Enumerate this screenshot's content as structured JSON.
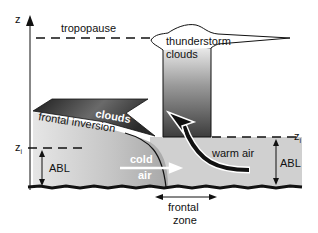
{
  "diagram": {
    "axis_label": "z",
    "tropopause_label": "tropopause",
    "thunderstorm_label_line1": "thunderstorm",
    "thunderstorm_label_line2": "clouds",
    "clouds_label": "clouds",
    "frontal_inversion_label": "frontal inversion",
    "zi_left_label": "z",
    "zi_left_sub": "i",
    "zi_right_label": "z",
    "zi_right_sub": "i",
    "abl_left_label": "ABL",
    "abl_right_label": "ABL",
    "cold_air_line1": "cold",
    "cold_air_line2": "air",
    "warm_air_label": "warm air",
    "frontal_zone_line1": "frontal",
    "frontal_zone_line2": "zone",
    "colors": {
      "abl_fill": "#cfcfcf",
      "cold_air_fill": "#bdbdbd",
      "cloud_dark": "#3a3a3a",
      "thunderstorm_dark": "#4a4a4a",
      "ground": "#111111"
    }
  }
}
